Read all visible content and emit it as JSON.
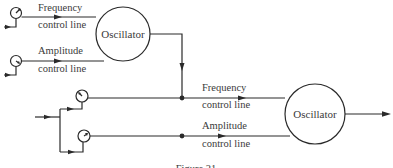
{
  "diagram": {
    "oscillator_1": {
      "label": "Oscillator",
      "inputs": [
        {
          "line1": "Frequency",
          "line2": "control line"
        },
        {
          "line1": "Amplitude",
          "line2": "control line"
        }
      ]
    },
    "oscillator_2": {
      "label": "Oscillator",
      "inputs": [
        {
          "line1": "Frequency",
          "line2": "control line"
        },
        {
          "line1": "Amplitude",
          "line2": "control line"
        }
      ]
    },
    "caption": "Figure 21"
  }
}
